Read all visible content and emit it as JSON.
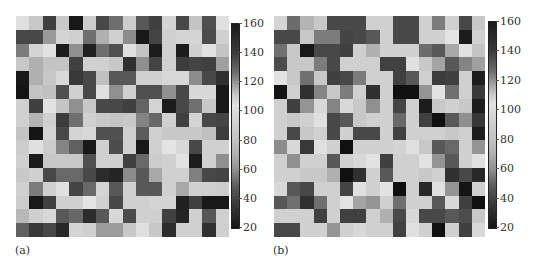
{
  "chart_data": [
    {
      "type": "heatmap",
      "title": "",
      "panel_label": "(a)",
      "rows": 16,
      "cols": 16,
      "colorbar": {
        "min": 20,
        "max": 160,
        "ticks": [
          "160",
          "140",
          "120",
          "100",
          "80",
          "60",
          "40",
          "20"
        ]
      },
      "gray_levels": [
        [
          "e0",
          "c8",
          "40",
          "c8",
          "18",
          "cc",
          "48",
          "6e",
          "cc",
          "58",
          "40",
          "d4",
          "48",
          "c4",
          "50",
          "e0"
        ],
        [
          "48",
          "48",
          "9a",
          "d4",
          "d0",
          "6e",
          "b0",
          "d0",
          "8c",
          "18",
          "44",
          "d0",
          "d4",
          "d4",
          "4c",
          "d0"
        ],
        [
          "7c",
          "d4",
          "e2",
          "1c",
          "90",
          "20",
          "6e",
          "50",
          "e0",
          "c4",
          "1c",
          "d0",
          "1c",
          "d0",
          "e2",
          "c4"
        ],
        [
          "c8",
          "b0",
          "c4",
          "c4",
          "40",
          "d0",
          "d0",
          "c8",
          "30",
          "90",
          "44",
          "d0",
          "3c",
          "44",
          "40",
          "a0"
        ],
        [
          "18",
          "b0",
          "c8",
          "d8",
          "38",
          "48",
          "c0",
          "58",
          "58",
          "d0",
          "d0",
          "d8",
          "d8",
          "8c",
          "48",
          "30"
        ],
        [
          "14",
          "c4",
          "c0",
          "50",
          "d0",
          "48",
          "e0",
          "90",
          "d0",
          "50",
          "50",
          "90",
          "48",
          "d8",
          "d8",
          "18"
        ],
        [
          "d0",
          "40",
          "e2",
          "c4",
          "90",
          "c8",
          "48",
          "48",
          "40",
          "64",
          "d4",
          "1c",
          "48",
          "70",
          "c8",
          "18"
        ],
        [
          "d0",
          "b4",
          "d0",
          "3c",
          "70",
          "d0",
          "c8",
          "c4",
          "c8",
          "84",
          "68",
          "d0",
          "40",
          "d4",
          "48",
          "44"
        ],
        [
          "c4",
          "14",
          "d4",
          "48",
          "d4",
          "d8",
          "50",
          "50",
          "d0",
          "5c",
          "d0",
          "c8",
          "c8",
          "c8",
          "c0",
          "3c"
        ],
        [
          "cc",
          "e0",
          "cc",
          "84",
          "60",
          "18",
          "d0",
          "4c",
          "d0",
          "18",
          "d0",
          "e4",
          "d8",
          "48",
          "d0",
          "d0"
        ],
        [
          "d0",
          "1c",
          "c8",
          "c8",
          "c8",
          "50",
          "d0",
          "d0",
          "40",
          "68",
          "cc",
          "d0",
          "e2",
          "1c",
          "d0",
          "90"
        ],
        [
          "c8",
          "d0",
          "48",
          "68",
          "68",
          "48",
          "2c",
          "24",
          "8c",
          "58",
          "a8",
          "d0",
          "d0",
          "80",
          "48",
          "44"
        ],
        [
          "d0",
          "7c",
          "d0",
          "e0",
          "44",
          "68",
          "d4",
          "58",
          "d0",
          "58",
          "58",
          "d0",
          "a8",
          "d0",
          "d0",
          "cc"
        ],
        [
          "cc",
          "18",
          "40",
          "d0",
          "d0",
          "e4",
          "d0",
          "48",
          "d0",
          "d0",
          "d4",
          "d4",
          "20",
          "40",
          "18",
          "18"
        ],
        [
          "b8",
          "d0",
          "d8",
          "58",
          "68",
          "2c",
          "58",
          "d8",
          "4c",
          "d0",
          "d0",
          "40",
          "24",
          "d0",
          "58",
          "d0"
        ],
        [
          "60",
          "38",
          "48",
          "28",
          "d4",
          "d0",
          "9c",
          "9c",
          "c8",
          "e0",
          "c8",
          "2c",
          "d0",
          "d0",
          "30",
          "d0"
        ]
      ]
    },
    {
      "type": "heatmap",
      "title": "",
      "panel_label": "(b)",
      "rows": 16,
      "cols": 16,
      "colorbar": {
        "min": 20,
        "max": 160,
        "ticks": [
          "160",
          "140",
          "120",
          "100",
          "80",
          "60",
          "40",
          "20"
        ]
      },
      "gray_levels": [
        [
          "d4",
          "6c",
          "b4",
          "c8",
          "48",
          "48",
          "48",
          "d0",
          "d0",
          "48",
          "48",
          "d0",
          "7c",
          "d0",
          "48",
          "c8"
        ],
        [
          "48",
          "48",
          "c8",
          "7c",
          "7c",
          "44",
          "48",
          "58",
          "d0",
          "48",
          "48",
          "d0",
          "d0",
          "e4",
          "1c",
          "d0"
        ],
        [
          "70",
          "c8",
          "18",
          "48",
          "48",
          "40",
          "d0",
          "b0",
          "d0",
          "d0",
          "d0",
          "6c",
          "58",
          "a8",
          "e2",
          "c4"
        ],
        [
          "4c",
          "c8",
          "c8",
          "7c",
          "48",
          "d0",
          "d0",
          "d0",
          "40",
          "40",
          "e0",
          "c8",
          "a4",
          "58",
          "84",
          "a0"
        ],
        [
          "e2",
          "c8",
          "70",
          "c8",
          "40",
          "48",
          "7c",
          "d0",
          "d0",
          "40",
          "58",
          "d0",
          "3c",
          "40",
          "d0",
          "1c"
        ],
        [
          "14",
          "d0",
          "30",
          "84",
          "c8",
          "7c",
          "d0",
          "30",
          "d0",
          "10",
          "10",
          "94",
          "e2",
          "70",
          "d0",
          "38"
        ],
        [
          "d0",
          "40",
          "94",
          "d8",
          "84",
          "d8",
          "c8",
          "90",
          "d0",
          "44",
          "d0",
          "1c",
          "c8",
          "d0",
          "c8",
          "1c"
        ],
        [
          "d0",
          "c8",
          "d0",
          "e0",
          "48",
          "58",
          "c8",
          "d0",
          "d0",
          "68",
          "d0",
          "40",
          "10",
          "58",
          "90",
          "38"
        ],
        [
          "d0",
          "48",
          "c8",
          "d0",
          "48",
          "d0",
          "48",
          "48",
          "d0",
          "40",
          "d0",
          "d0",
          "d0",
          "c8",
          "d0",
          "1c"
        ],
        [
          "8c",
          "d8",
          "38",
          "e0",
          "d0",
          "10",
          "d0",
          "d0",
          "d0",
          "d4",
          "e0",
          "c8",
          "58",
          "68",
          "d0",
          "94"
        ],
        [
          "d0",
          "90",
          "d0",
          "d0",
          "58",
          "d0",
          "d8",
          "e2",
          "40",
          "d0",
          "d0",
          "e2",
          "94",
          "58",
          "d0",
          "e0"
        ],
        [
          "d0",
          "d0",
          "c8",
          "c8",
          "b0",
          "10",
          "30",
          "d0",
          "58",
          "d0",
          "d0",
          "c8",
          "d0",
          "30",
          "48",
          "28"
        ],
        [
          "d8",
          "58",
          "48",
          "d0",
          "d0",
          "44",
          "e0",
          "d0",
          "e2",
          "10",
          "d0",
          "28",
          "e0",
          "94",
          "14",
          "d0"
        ],
        [
          "58",
          "70",
          "30",
          "70",
          "d0",
          "e4",
          "a4",
          "94",
          "d0",
          "70",
          "d0",
          "d0",
          "58",
          "d8",
          "40",
          "10"
        ],
        [
          "d0",
          "d0",
          "d0",
          "40",
          "d0",
          "40",
          "40",
          "d0",
          "b0",
          "48",
          "d8",
          "48",
          "48",
          "58",
          "4c",
          "c8"
        ],
        [
          "48",
          "48",
          "d0",
          "d0",
          "94",
          "d0",
          "d8",
          "d0",
          "d0",
          "40",
          "e0",
          "d0",
          "10",
          "d0",
          "40",
          "d8"
        ]
      ]
    }
  ]
}
